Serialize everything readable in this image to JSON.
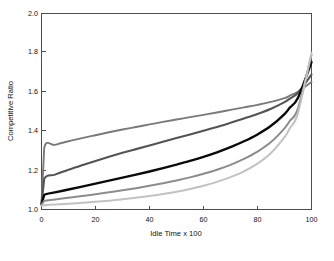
{
  "chart_data": {
    "type": "line",
    "title": "",
    "subtitle": "",
    "xlabel": "Idle Time x 100",
    "ylabel": "Competitive Ratio",
    "xlim": [
      0,
      100
    ],
    "ylim": [
      1.0,
      2.0
    ],
    "xticks": [
      0,
      20,
      40,
      60,
      80,
      100
    ],
    "yticks": [
      1.0,
      1.2,
      1.4,
      1.6,
      1.8,
      2.0
    ],
    "xtick_labels": [
      "0",
      "20",
      "40",
      "60",
      "80",
      "100"
    ],
    "ytick_labels": [
      "1.0",
      "1.2",
      "1.4",
      "1.6",
      "1.8",
      "2.0"
    ],
    "grid": false,
    "legend": "none",
    "x": [
      0,
      1,
      5,
      10,
      15,
      20,
      25,
      30,
      35,
      40,
      45,
      50,
      55,
      60,
      65,
      70,
      75,
      80,
      85,
      90,
      92,
      95,
      100
    ],
    "series": [
      {
        "name": "series-1",
        "color": "#7a7a7a",
        "width": 1.9,
        "values": [
          1.03,
          1.315,
          1.33,
          1.348,
          1.364,
          1.379,
          1.394,
          1.408,
          1.421,
          1.434,
          1.447,
          1.459,
          1.471,
          1.483,
          1.495,
          1.508,
          1.521,
          1.534,
          1.549,
          1.568,
          1.581,
          1.601,
          1.65
        ]
      },
      {
        "name": "series-2",
        "color": "#545454",
        "width": 2.1,
        "values": [
          1.028,
          1.157,
          1.178,
          1.203,
          1.226,
          1.248,
          1.269,
          1.289,
          1.308,
          1.327,
          1.346,
          1.365,
          1.383,
          1.402,
          1.421,
          1.442,
          1.464,
          1.487,
          1.514,
          1.548,
          1.566,
          1.596,
          1.688
        ]
      },
      {
        "name": "series-3",
        "color": "#0a0a0a",
        "width": 2.4,
        "values": [
          1.026,
          1.074,
          1.087,
          1.102,
          1.117,
          1.132,
          1.147,
          1.163,
          1.178,
          1.194,
          1.211,
          1.229,
          1.248,
          1.269,
          1.292,
          1.318,
          1.348,
          1.383,
          1.427,
          1.487,
          1.52,
          1.57,
          1.752
        ]
      },
      {
        "name": "series-4",
        "color": "#8c8c8c",
        "width": 2.0,
        "values": [
          1.024,
          1.044,
          1.051,
          1.06,
          1.069,
          1.078,
          1.088,
          1.098,
          1.109,
          1.121,
          1.134,
          1.148,
          1.164,
          1.182,
          1.203,
          1.228,
          1.258,
          1.295,
          1.344,
          1.414,
          1.453,
          1.516,
          1.79
        ]
      },
      {
        "name": "series-5",
        "color": "#c2c2c2",
        "width": 2.0,
        "values": [
          1.02,
          1.022,
          1.025,
          1.029,
          1.034,
          1.039,
          1.045,
          1.052,
          1.06,
          1.069,
          1.079,
          1.091,
          1.105,
          1.121,
          1.141,
          1.165,
          1.195,
          1.234,
          1.288,
          1.369,
          1.415,
          1.493,
          1.8
        ]
      }
    ]
  },
  "axes": {
    "y_axis_label": "Competitive Ratio",
    "x_axis_label": "Idle Time x 100"
  }
}
